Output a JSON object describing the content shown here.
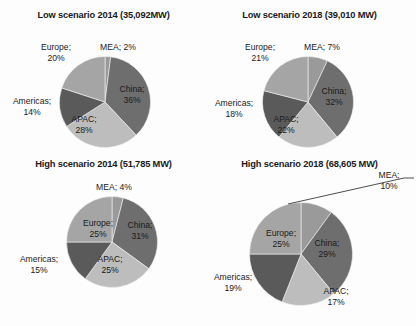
{
  "figure": {
    "type": "pie-chart-grid",
    "rows": 2,
    "cols": 2,
    "palette": {
      "MEA": "#9a9a9a",
      "China": "#6e6e6e",
      "APAC": "#bdbdbd",
      "Americas": "#5a5a5a",
      "Europe": "#a5a5a5",
      "background": "#fdfdfd",
      "text": "#1b1b1b",
      "leader_line": "#3a3a3a"
    }
  },
  "chart_data": [
    {
      "type": "pie",
      "title": "Low scenario 2014 (35,092MW)",
      "categories": [
        "MEA",
        "China",
        "APAC",
        "Americas",
        "Europe"
      ],
      "values": [
        2,
        36,
        28,
        14,
        20
      ],
      "labels": [
        {
          "name": "MEA",
          "text": "MEA; 2%",
          "line1": "MEA; 2%",
          "line2": "",
          "placement": "outside"
        },
        {
          "name": "China",
          "text": "China; 36%",
          "line1": "China;",
          "line2": "36%",
          "placement": "inside"
        },
        {
          "name": "APAC",
          "text": "APAC; 28%",
          "line1": "APAC;",
          "line2": "28%",
          "placement": "inside"
        },
        {
          "name": "Americas",
          "text": "Americas; 14%",
          "line1": "Americas;",
          "line2": "14%",
          "placement": "outside"
        },
        {
          "name": "Europe",
          "text": "Europe; 20%",
          "line1": "Europe;",
          "line2": "20%",
          "placement": "outside"
        }
      ]
    },
    {
      "type": "pie",
      "title": "Low scenario 2018 (39,010 MW)",
      "categories": [
        "MEA",
        "China",
        "APAC",
        "Americas",
        "Europe"
      ],
      "values": [
        7,
        32,
        22,
        18,
        21
      ],
      "labels": [
        {
          "name": "MEA",
          "text": "MEA; 7%",
          "line1": "MEA; 7%",
          "line2": "",
          "placement": "outside"
        },
        {
          "name": "China",
          "text": "China; 32%",
          "line1": "China;",
          "line2": "32%",
          "placement": "inside"
        },
        {
          "name": "APAC",
          "text": "APAC; 22%",
          "line1": "APAC;",
          "line2": "22%",
          "placement": "inside"
        },
        {
          "name": "Americas",
          "text": "Americas; 18%",
          "line1": "Americas;",
          "line2": "18%",
          "placement": "outside"
        },
        {
          "name": "Europe",
          "text": "Europe; 21%",
          "line1": "Europe;",
          "line2": "21%",
          "placement": "outside"
        }
      ]
    },
    {
      "type": "pie",
      "title": "High scenario 2014 (51,785 MW)",
      "categories": [
        "MEA",
        "China",
        "APAC",
        "Americas",
        "Europe"
      ],
      "values": [
        4,
        31,
        25,
        15,
        25
      ],
      "labels": [
        {
          "name": "MEA",
          "text": "MEA; 4%",
          "line1": "MEA; 4%",
          "line2": "",
          "placement": "outside"
        },
        {
          "name": "China",
          "text": "China; 31%",
          "line1": "China;",
          "line2": "31%",
          "placement": "inside"
        },
        {
          "name": "APAC",
          "text": "APAC; 25%",
          "line1": "APAC;",
          "line2": "25%",
          "placement": "inside"
        },
        {
          "name": "Americas",
          "text": "Americas; 15%",
          "line1": "Americas;",
          "line2": "15%",
          "placement": "outside"
        },
        {
          "name": "Europe",
          "text": "Europe; 25%",
          "line1": "Europe;",
          "line2": "25%",
          "placement": "inside"
        }
      ]
    },
    {
      "type": "pie",
      "title": "High scenario 2018 (68,605 MW)",
      "categories": [
        "MEA",
        "China",
        "APAC",
        "Americas",
        "Europe"
      ],
      "values": [
        10,
        29,
        17,
        19,
        25
      ],
      "labels": [
        {
          "name": "MEA",
          "text": "MEA; 10%",
          "line1": "MEA;",
          "line2": "10%",
          "placement": "outside-leader"
        },
        {
          "name": "China",
          "text": "China; 29%",
          "line1": "China;",
          "line2": "29%",
          "placement": "inside"
        },
        {
          "name": "APAC",
          "text": "APAC; 17%",
          "line1": "APAC;",
          "line2": "17%",
          "placement": "outside"
        },
        {
          "name": "Americas",
          "text": "Americas; 19%",
          "line1": "Americas;",
          "line2": "19%",
          "placement": "outside"
        },
        {
          "name": "Europe",
          "text": "Europe; 25%",
          "line1": "Europe;",
          "line2": "25%",
          "placement": "inside"
        }
      ]
    }
  ]
}
